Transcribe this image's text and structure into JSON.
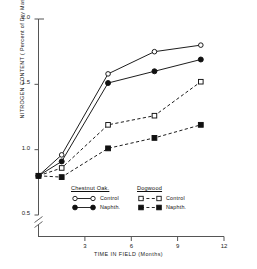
{
  "chart_data": {
    "type": "line",
    "title": "",
    "xlabel": "TIME IN FIELD (Months)",
    "ylabel": "NITROGEN CONTENT ( Percent of Dry Mass )",
    "xlim": [
      0,
      12
    ],
    "ylim": [
      0.5,
      2.0
    ],
    "y_axis_break": true,
    "grid": false,
    "legend_position": "lower-center",
    "xticks": [
      3,
      6,
      9,
      12
    ],
    "xtick_labels": [
      "3",
      "6",
      "9",
      "12"
    ],
    "yticks": [
      0.5,
      1.0,
      1.5,
      2.0
    ],
    "ytick_labels": [
      "0.5",
      "1.0",
      "1.5",
      "2.0"
    ],
    "x": [
      0,
      1.5,
      4.5,
      7.5,
      10.5
    ],
    "series": [
      {
        "name": "Chestnut Oak Control",
        "group": "Chestnut Oak",
        "label": "Control",
        "marker": "open-circle",
        "linestyle": "solid",
        "color": "#111111",
        "values": [
          0.8,
          0.96,
          1.58,
          1.75,
          1.8
        ]
      },
      {
        "name": "Chestnut Oak Naphth.",
        "group": "Chestnut Oak",
        "label": "Naphth.",
        "marker": "filled-circle",
        "linestyle": "solid",
        "color": "#111111",
        "values": [
          0.8,
          0.91,
          1.51,
          1.6,
          1.69
        ]
      },
      {
        "name": "Dogwood Control",
        "group": "Dogwood",
        "label": "Control",
        "marker": "open-square",
        "linestyle": "dashed",
        "color": "#111111",
        "values": [
          0.8,
          0.86,
          1.19,
          1.26,
          1.52
        ]
      },
      {
        "name": "Dogwood Naphth.",
        "group": "Dogwood",
        "label": "Naphth.",
        "marker": "filled-square",
        "linestyle": "dashed",
        "color": "#111111",
        "values": [
          0.8,
          0.79,
          1.01,
          1.09,
          1.19
        ]
      }
    ]
  },
  "axes": {
    "ylabel": "NITROGEN CONTENT ( Percent of Dry Mass )",
    "xlabel": "TIME IN FIELD (Months)",
    "ytick_0": "2.0",
    "ytick_1": "1.5",
    "ytick_2": "1.0",
    "ytick_3": "0.5",
    "xtick_0": "3",
    "xtick_1": "6",
    "xtick_2": "9",
    "xtick_3": "12"
  },
  "legend": {
    "left_title": "Chestnut Oak.",
    "right_title": "Dogwood",
    "left_row1": "Control",
    "left_row2": "Naphth.",
    "right_row1": "Control",
    "right_row2": "Naphth."
  }
}
